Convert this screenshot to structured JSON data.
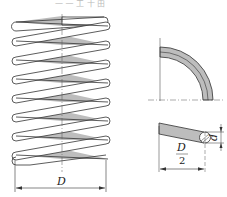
{
  "figure": {
    "caption_partial": "— — 工 十 由",
    "colors": {
      "stroke": "#333333",
      "fill_gray": "#bdbdbd",
      "background": "#ffffff"
    }
  },
  "spring_view": {
    "coil_count": 8,
    "dimension_label": "D"
  },
  "section_view": {
    "description": "quarter-circle coil section"
  },
  "wire_view": {
    "half_diameter_label_num": "D",
    "half_diameter_label_den": "2",
    "wire_diameter_label": "d"
  }
}
